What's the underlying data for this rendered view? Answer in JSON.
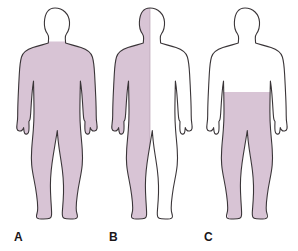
{
  "diagram": {
    "background_color": "#ffffff",
    "shade_color": "#d8c4d5",
    "outline_color": "#3a3538",
    "unshaded_color": "#ffffff",
    "figure_count": 3
  },
  "figures": [
    {
      "id": "a",
      "label": "A",
      "shading_pattern": "body-below-neck",
      "head_shaded": "no",
      "arms_shaded": "yes",
      "legs_shaded": "yes",
      "torso_shaded": "yes",
      "split": "none",
      "shade_color": "#d8c4d5"
    },
    {
      "id": "b",
      "label": "B",
      "shading_pattern": "left-half-vertical",
      "head_shaded": "left-half",
      "arms_shaded": "left-only",
      "legs_shaded": "left-only",
      "torso_shaded": "left-half",
      "split": "vertical-midline",
      "shade_color": "#d8c4d5"
    },
    {
      "id": "c",
      "label": "C",
      "shading_pattern": "below-waist",
      "head_shaded": "no",
      "arms_shaded": "no",
      "legs_shaded": "yes",
      "torso_shaded": "below-waist-only",
      "split": "horizontal-waist",
      "shade_color": "#d8c4d5"
    }
  ]
}
